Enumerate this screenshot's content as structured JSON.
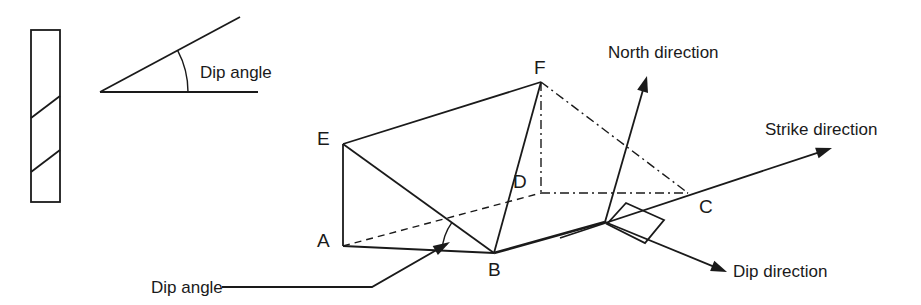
{
  "figure": {
    "title_present": false,
    "background": "#ffffff",
    "ink_color": "#1a1a1a",
    "width": 921,
    "height": 305
  },
  "core_sample": {
    "name": "borehole-core-sample",
    "rect": {
      "x": 31,
      "y": 30,
      "width": 29,
      "height": 172
    },
    "bedding_planes": [
      {
        "x1": 31,
        "y1": 118,
        "x2": 60,
        "y2": 96
      },
      {
        "x1": 31,
        "y1": 172,
        "x2": 60,
        "y2": 150
      }
    ]
  },
  "dip_angle_inset": {
    "label": "Dip angle",
    "label_x": 200,
    "label_y": 78,
    "apex": {
      "x": 100,
      "y": 92
    },
    "inclined_end": {
      "x": 240,
      "y": 17
    },
    "baseline_end": {
      "x": 258,
      "y": 92
    },
    "arc": {
      "cx": 100,
      "cy": 92,
      "r": 88
    }
  },
  "block": {
    "vertices": {
      "A": {
        "x": 343,
        "y": 246,
        "label": "A",
        "label_x": 317,
        "label_y": 247
      },
      "B": {
        "x": 494,
        "y": 253,
        "label": "B",
        "label_x": 488,
        "label_y": 276
      },
      "C": {
        "x": 688,
        "y": 193,
        "label": "C",
        "label_x": 699,
        "label_y": 213
      },
      "D": {
        "x": 541,
        "y": 193,
        "label": "D",
        "label_x": 513,
        "label_y": 188
      },
      "E": {
        "x": 343,
        "y": 144,
        "label": "E",
        "label_x": 317,
        "label_y": 145
      },
      "F": {
        "x": 541,
        "y": 82,
        "label": "F",
        "label_x": 534,
        "label_y": 74
      }
    },
    "origin": {
      "x": 605,
      "y": 222
    },
    "solid_edges": [
      [
        "E",
        "F"
      ],
      [
        "E",
        "A"
      ],
      [
        "E",
        "B"
      ],
      [
        "A",
        "B"
      ],
      [
        "F",
        "B"
      ]
    ],
    "dashed_edges": [
      [
        "A",
        "D"
      ]
    ],
    "dashdot_edges": [
      [
        "F",
        "D"
      ],
      [
        "D",
        "C"
      ],
      [
        "F",
        "C"
      ]
    ]
  },
  "vectors": [
    {
      "name": "north-direction",
      "label": "North direction",
      "label_x": 608,
      "label_y": 58,
      "from": {
        "x": 605,
        "y": 222
      },
      "to": {
        "x": 647,
        "y": 76
      }
    },
    {
      "name": "strike-direction",
      "label": "Strike direction",
      "label_x": 765,
      "label_y": 135,
      "from": {
        "x": 560,
        "y": 238
      },
      "to": {
        "x": 832,
        "y": 148
      }
    },
    {
      "name": "dip-direction",
      "label": "Dip direction",
      "label_x": 733,
      "label_y": 277,
      "from": {
        "x": 605,
        "y": 222
      },
      "to": {
        "x": 727,
        "y": 272
      }
    }
  ],
  "right_angle_marker": {
    "name": "perpendicular-marker",
    "points": "626,203 664,220 645,243 607,224"
  },
  "dip_angle_callout": {
    "label": "Dip angle",
    "label_x": 151,
    "label_y": 293,
    "leader": [
      {
        "x": 222,
        "y": 287
      },
      {
        "x": 372,
        "y": 287
      },
      {
        "x": 447,
        "y": 244
      }
    ],
    "arrow_tip": {
      "x": 450,
      "y": 242
    },
    "arc": {
      "cx": 494,
      "cy": 253,
      "r": 52
    }
  }
}
